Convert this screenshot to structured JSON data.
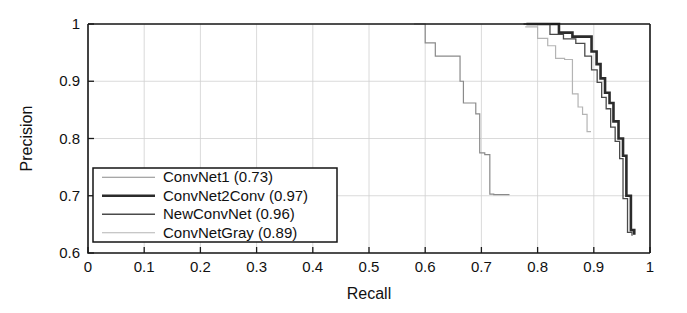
{
  "chart_data": {
    "type": "line",
    "title": "",
    "xlabel": "Recall",
    "ylabel": "Precision",
    "xlim": [
      0,
      1
    ],
    "ylim": [
      0.6,
      1
    ],
    "grid": true,
    "legend_position": "lower-left",
    "xticks": [
      "0",
      "0.1",
      "0.2",
      "0.3",
      "0.4",
      "0.5",
      "0.6",
      "0.7",
      "0.8",
      "0.9",
      "1"
    ],
    "xtick_values": [
      0,
      0.1,
      0.2,
      0.3,
      0.4,
      0.5,
      0.6,
      0.7,
      0.8,
      0.9,
      1
    ],
    "yticks": [
      "0.6",
      "0.7",
      "0.8",
      "0.9",
      "1"
    ],
    "ytick_values": [
      0.6,
      0.7,
      0.8,
      0.9,
      1
    ],
    "series": [
      {
        "name": "ConvNet1",
        "score": "0.73",
        "legend_label": "ConvNet1 (0.73)",
        "color": "#8a8a8a",
        "width": 1.2,
        "step": true,
        "x": [
          0.58,
          0.58,
          0.6,
          0.6,
          0.618,
          0.618,
          0.628,
          0.628,
          0.662,
          0.662,
          0.668,
          0.668,
          0.69,
          0.69,
          0.697,
          0.697,
          0.706,
          0.706,
          0.715,
          0.715,
          0.722,
          0.722,
          0.75
        ],
        "y": [
          1.0,
          1.0,
          1.0,
          0.967,
          0.967,
          0.944,
          0.944,
          0.944,
          0.944,
          0.9,
          0.9,
          0.862,
          0.862,
          0.843,
          0.843,
          0.775,
          0.775,
          0.772,
          0.772,
          0.703,
          0.703,
          0.702,
          0.702
        ]
      },
      {
        "name": "ConvNet2Conv",
        "score": "0.97",
        "legend_label": "ConvNet2Conv (0.97)",
        "color": "#2b2b2b",
        "width": 2.6,
        "step": true,
        "x": [
          0.78,
          0.838,
          0.838,
          0.862,
          0.862,
          0.878,
          0.878,
          0.896,
          0.896,
          0.905,
          0.905,
          0.912,
          0.912,
          0.92,
          0.92,
          0.928,
          0.928,
          0.935,
          0.935,
          0.944,
          0.944,
          0.952,
          0.952,
          0.958,
          0.958,
          0.966,
          0.966,
          0.972
        ],
        "y": [
          1.0,
          1.0,
          0.985,
          0.985,
          0.978,
          0.978,
          0.978,
          0.978,
          0.952,
          0.952,
          0.93,
          0.93,
          0.905,
          0.905,
          0.88,
          0.88,
          0.862,
          0.862,
          0.83,
          0.83,
          0.8,
          0.8,
          0.77,
          0.77,
          0.7,
          0.7,
          0.64,
          0.632
        ]
      },
      {
        "name": "NewConvNet",
        "score": "0.96",
        "legend_label": "NewConvNet (0.96)",
        "color": "#4a4a4a",
        "width": 1.3,
        "step": true,
        "x": [
          0.775,
          0.822,
          0.822,
          0.846,
          0.846,
          0.868,
          0.868,
          0.884,
          0.884,
          0.896,
          0.896,
          0.906,
          0.906,
          0.914,
          0.914,
          0.922,
          0.922,
          0.93,
          0.93,
          0.938,
          0.938,
          0.946,
          0.946,
          0.952,
          0.952,
          0.96,
          0.96,
          0.968
        ],
        "y": [
          1.0,
          1.0,
          0.982,
          0.982,
          0.974,
          0.974,
          0.966,
          0.966,
          0.944,
          0.944,
          0.92,
          0.92,
          0.898,
          0.898,
          0.872,
          0.872,
          0.852,
          0.852,
          0.82,
          0.82,
          0.795,
          0.795,
          0.765,
          0.765,
          0.695,
          0.695,
          0.636,
          0.63
        ]
      },
      {
        "name": "ConvNetGray",
        "score": "0.89",
        "legend_label": "ConvNetGray (0.89)",
        "color": "#b4b4b4",
        "width": 1.2,
        "step": true,
        "x": [
          0.778,
          0.8,
          0.8,
          0.818,
          0.818,
          0.832,
          0.832,
          0.848,
          0.848,
          0.862,
          0.862,
          0.872,
          0.872,
          0.88,
          0.88,
          0.888,
          0.888,
          0.895
        ],
        "y": [
          0.995,
          0.995,
          0.975,
          0.975,
          0.962,
          0.962,
          0.94,
          0.94,
          0.938,
          0.938,
          0.878,
          0.878,
          0.855,
          0.855,
          0.842,
          0.842,
          0.812,
          0.812
        ]
      }
    ]
  },
  "plot_geometry": {
    "left": 88,
    "right": 650,
    "top": 24,
    "bottom": 253
  },
  "legend": {
    "x": 93,
    "y": 168,
    "width": 244,
    "height": 74
  }
}
